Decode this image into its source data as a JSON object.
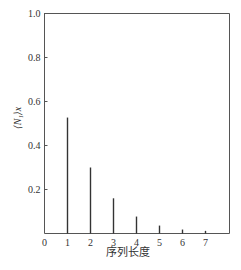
{
  "chart_data": {
    "type": "bar",
    "title": "",
    "xlabel": "序列长度",
    "ylabel": "⟨N₁⟩x",
    "categories": [
      1,
      2,
      3,
      4,
      5,
      6,
      7
    ],
    "values": [
      0.527,
      0.3,
      0.16,
      0.077,
      0.036,
      0.018,
      0.012
    ],
    "xlim": [
      0,
      8
    ],
    "ylim": [
      0,
      1.0
    ],
    "x_ticks": [
      "0",
      "1",
      "2",
      "3",
      "4",
      "5",
      "6",
      "7"
    ],
    "y_ticks": [
      "0.2",
      "0.4",
      "0.6",
      "0.8",
      "1.0"
    ],
    "grid": false,
    "legend": null,
    "bar_style": "thin vertical lines"
  },
  "colors": {
    "axis": "#555555",
    "bar": "#333333",
    "text": "#333333"
  }
}
